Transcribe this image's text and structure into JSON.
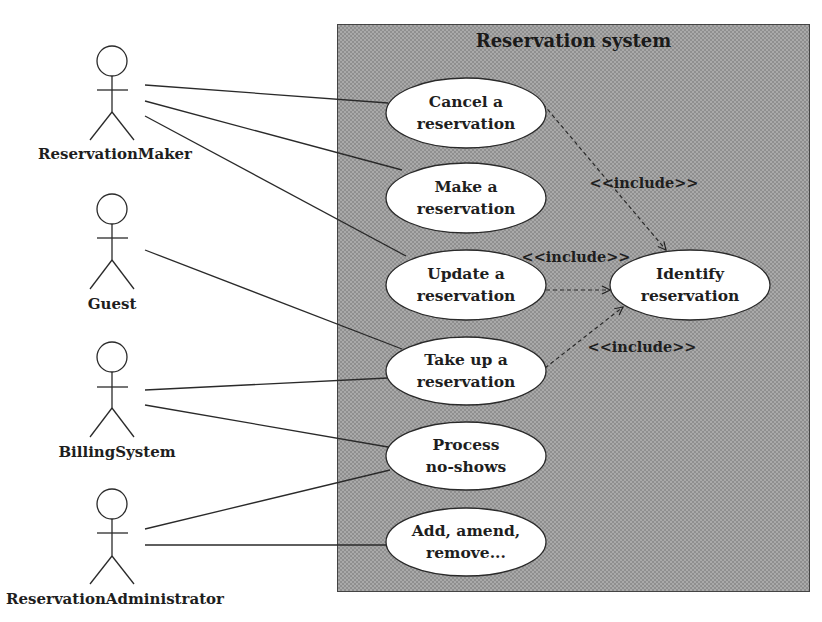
{
  "system": {
    "title": "Reservation system",
    "fill_color": "#a9a9a9",
    "border_color": "#444444"
  },
  "actors": [
    {
      "id": "reservation-maker",
      "label": "ReservationMaker"
    },
    {
      "id": "guest",
      "label": "Guest"
    },
    {
      "id": "billing-system",
      "label": "BillingSystem"
    },
    {
      "id": "reservation-administrator",
      "label": "ReservationAdministrator"
    }
  ],
  "use_cases": [
    {
      "id": "cancel",
      "line1": "Cancel a",
      "line2": "reservation"
    },
    {
      "id": "make",
      "line1": "Make a",
      "line2": "reservation"
    },
    {
      "id": "update",
      "line1": "Update a",
      "line2": "reservation"
    },
    {
      "id": "take-up",
      "line1": "Take up a",
      "line2": "reservation"
    },
    {
      "id": "process-no-shows",
      "line1": "Process",
      "line2": "no-shows"
    },
    {
      "id": "add-amend-remove",
      "line1": "Add, amend,",
      "line2": "remove..."
    },
    {
      "id": "identify",
      "line1": "Identify",
      "line2": "reservation"
    }
  ],
  "associations": [
    {
      "actor": "ReservationMaker",
      "use_case": "Cancel a reservation"
    },
    {
      "actor": "ReservationMaker",
      "use_case": "Make a reservation"
    },
    {
      "actor": "ReservationMaker",
      "use_case": "Update a reservation"
    },
    {
      "actor": "Guest",
      "use_case": "Take up a reservation"
    },
    {
      "actor": "BillingSystem",
      "use_case": "Take up a reservation"
    },
    {
      "actor": "BillingSystem",
      "use_case": "Process no-shows"
    },
    {
      "actor": "ReservationAdministrator",
      "use_case": "Process no-shows"
    },
    {
      "actor": "ReservationAdministrator",
      "use_case": "Add, amend, remove..."
    }
  ],
  "includes": [
    {
      "from": "Cancel a reservation",
      "to": "Identify reservation",
      "label": "<<include>>"
    },
    {
      "from": "Update a reservation",
      "to": "Identify reservation",
      "label": "<<include>>"
    },
    {
      "from": "Take up a reservation",
      "to": "Identify reservation",
      "label": "<<include>>"
    }
  ]
}
